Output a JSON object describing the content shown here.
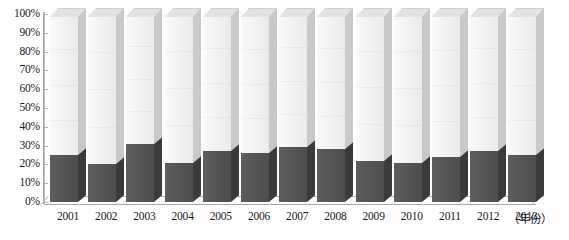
{
  "chart_data": {
    "type": "bar",
    "subtype": "100% stacked column (3D)",
    "title": "",
    "xlabel": "（年份）",
    "ylabel": "",
    "ylim": [
      0,
      100
    ],
    "ytick_labels": [
      "100%",
      "90%",
      "80%",
      "70%",
      "60%",
      "50%",
      "40%",
      "30%",
      "20%",
      "10%",
      "0%"
    ],
    "ytick_values": [
      100,
      90,
      80,
      70,
      60,
      50,
      40,
      30,
      20,
      10,
      0
    ],
    "grid": false,
    "legend": "none",
    "categories": [
      "2001",
      "2002",
      "2003",
      "2004",
      "2005",
      "2006",
      "2007",
      "2008",
      "2009",
      "2010",
      "2011",
      "2012",
      "2013"
    ],
    "series": [
      {
        "name": "lower-segment",
        "color": "#555555",
        "values": [
          25,
          20,
          31,
          21,
          27,
          26,
          29,
          28,
          22,
          21,
          24,
          27,
          25
        ]
      },
      {
        "name": "upper-segment",
        "color": "#efefef",
        "values": [
          75,
          80,
          69,
          79,
          73,
          74,
          71,
          72,
          78,
          79,
          76,
          73,
          75
        ]
      }
    ]
  },
  "axis": {
    "x_title": "（年份）"
  },
  "colors": {
    "dark_segment": "#555555",
    "light_segment": "#efefef",
    "side_dark": "#3a3a3a",
    "side_light": "#c9c9c9",
    "axis": "#a8a8a8",
    "text": "#1a1a1a"
  }
}
